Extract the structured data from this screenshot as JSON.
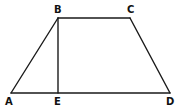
{
  "diagram": {
    "type": "geometry",
    "shape": "trapezoid",
    "points": {
      "A": {
        "label": "A",
        "x": 11,
        "y": 93,
        "lx": 5,
        "ly": 105
      },
      "B": {
        "label": "B",
        "x": 58,
        "y": 18,
        "lx": 54,
        "ly": 13
      },
      "C": {
        "label": "C",
        "x": 130,
        "y": 18,
        "lx": 127,
        "ly": 13
      },
      "D": {
        "label": "D",
        "x": 170,
        "y": 93,
        "lx": 166,
        "ly": 105
      },
      "E": {
        "label": "E",
        "x": 58,
        "y": 93,
        "lx": 54,
        "ly": 105
      }
    },
    "segments": [
      [
        "A",
        "B"
      ],
      [
        "B",
        "C"
      ],
      [
        "C",
        "D"
      ],
      [
        "D",
        "A"
      ],
      [
        "B",
        "E"
      ]
    ],
    "colors": {
      "line": "#1a1a1a",
      "background": "#ffffff"
    }
  }
}
